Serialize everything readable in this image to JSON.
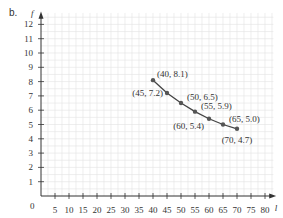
{
  "panel_label": "b.",
  "chart_data": {
    "type": "line",
    "title": "",
    "xlabel": "l",
    "ylabel": "f",
    "xlim": [
      0,
      80
    ],
    "ylim": [
      0,
      12
    ],
    "x_ticks": [
      5,
      10,
      15,
      20,
      25,
      30,
      35,
      40,
      45,
      50,
      55,
      60,
      65,
      70,
      75,
      80
    ],
    "y_ticks": [
      1,
      2,
      3,
      4,
      5,
      6,
      7,
      8,
      9,
      10,
      11,
      12
    ],
    "origin_label": "0",
    "grid": true,
    "series": [
      {
        "name": "f vs l",
        "points": [
          {
            "x": 40,
            "y": 8.1,
            "label": "(40, 8.1)"
          },
          {
            "x": 45,
            "y": 7.2,
            "label": "(45, 7.2)"
          },
          {
            "x": 50,
            "y": 6.5,
            "label": "(50, 6.5)"
          },
          {
            "x": 55,
            "y": 5.9,
            "label": "(55, 5.9)"
          },
          {
            "x": 60,
            "y": 5.4,
            "label": "(60, 5.4)"
          },
          {
            "x": 65,
            "y": 5.0,
            "label": "(65, 5.0)"
          },
          {
            "x": 70,
            "y": 4.7,
            "label": "(70, 4.7)"
          }
        ]
      }
    ]
  },
  "colors": {
    "grid": "#e3e3e3",
    "axis": "#333333",
    "line": "#444444",
    "point": "#555555",
    "text": "#333333"
  }
}
